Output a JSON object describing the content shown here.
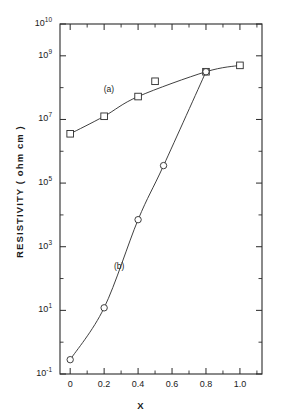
{
  "chart_data": {
    "type": "line",
    "title": "",
    "xlabel": "X",
    "ylabel": "RESISTIVITY ( ohm cm )",
    "xlim": [
      -0.06,
      1.13
    ],
    "ylim_log10": [
      -1,
      10
    ],
    "yscale": "log",
    "xscale": "linear",
    "grid": false,
    "legend": "inline-annotations",
    "x_ticks": [
      {
        "value": 0,
        "label": "0"
      },
      {
        "value": 0.2,
        "label": "0.2"
      },
      {
        "value": 0.4,
        "label": "0.4"
      },
      {
        "value": 0.6,
        "label": "0.6"
      },
      {
        "value": 0.8,
        "label": "0.8"
      },
      {
        "value": 1.0,
        "label": "1.0"
      }
    ],
    "x_minor_ticks": [
      0.1,
      0.3,
      0.5,
      0.7,
      0.9,
      1.1
    ],
    "y_ticks": [
      {
        "exp": 10,
        "label": "10",
        "sup": "10"
      },
      {
        "exp": 9,
        "label": "10",
        "sup": "9"
      },
      {
        "exp": 7,
        "label": "10",
        "sup": "7"
      },
      {
        "exp": 5,
        "label": "10",
        "sup": "5"
      },
      {
        "exp": 3,
        "label": "10",
        "sup": "3"
      },
      {
        "exp": 1,
        "label": "10",
        "sup": "1"
      },
      {
        "exp": -1,
        "label": "10",
        "sup": "-1"
      }
    ],
    "y_minor_ticks_exp": [
      8,
      6,
      4,
      2,
      0
    ],
    "series": [
      {
        "name": "(a)",
        "marker": "open-square",
        "annotation": "(a)",
        "points": [
          {
            "x": 0.0,
            "y_log10": 6.55
          },
          {
            "x": 0.2,
            "y_log10": 7.1
          },
          {
            "x": 0.4,
            "y_log10": 7.72
          },
          {
            "x": 0.8,
            "y_log10": 8.5
          },
          {
            "x": 1.0,
            "y_log10": 8.7
          }
        ],
        "outlier_points": [
          {
            "x": 0.5,
            "y_log10": 8.2
          }
        ]
      },
      {
        "name": "(b)",
        "marker": "open-circle",
        "annotation": "(b)",
        "points": [
          {
            "x": 0.0,
            "y_log10": -0.55
          },
          {
            "x": 0.2,
            "y_log10": 1.08
          },
          {
            "x": 0.4,
            "y_log10": 3.85
          },
          {
            "x": 0.55,
            "y_log10": 5.55
          },
          {
            "x": 0.8,
            "y_log10": 8.5
          }
        ]
      }
    ],
    "annotations": [
      {
        "text": "(a)",
        "x": 0.245,
        "y_log10": 7.95
      },
      {
        "text": "(b)",
        "x": 0.305,
        "y_log10": 2.4
      }
    ]
  }
}
